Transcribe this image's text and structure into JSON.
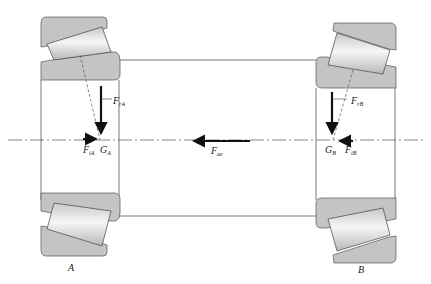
{
  "diagram": {
    "colors": {
      "race": "#c4c4c4",
      "outline": "#555555",
      "force": "#111111",
      "background": "#ffffff"
    },
    "bearings": [
      {
        "id": "A",
        "label": "A"
      },
      {
        "id": "B",
        "label": "B"
      }
    ],
    "forces": {
      "FrA": {
        "base": "F",
        "sub": "rA"
      },
      "FiA": {
        "base": "F",
        "sub": "iA"
      },
      "GA": {
        "base": "G",
        "sub": "A"
      },
      "FrB": {
        "base": "F",
        "sub": "rB"
      },
      "FiB": {
        "base": "F",
        "sub": "iB"
      },
      "GB": {
        "base": "G",
        "sub": "B"
      },
      "Fae": {
        "base": "F",
        "sub": "ae"
      }
    }
  }
}
